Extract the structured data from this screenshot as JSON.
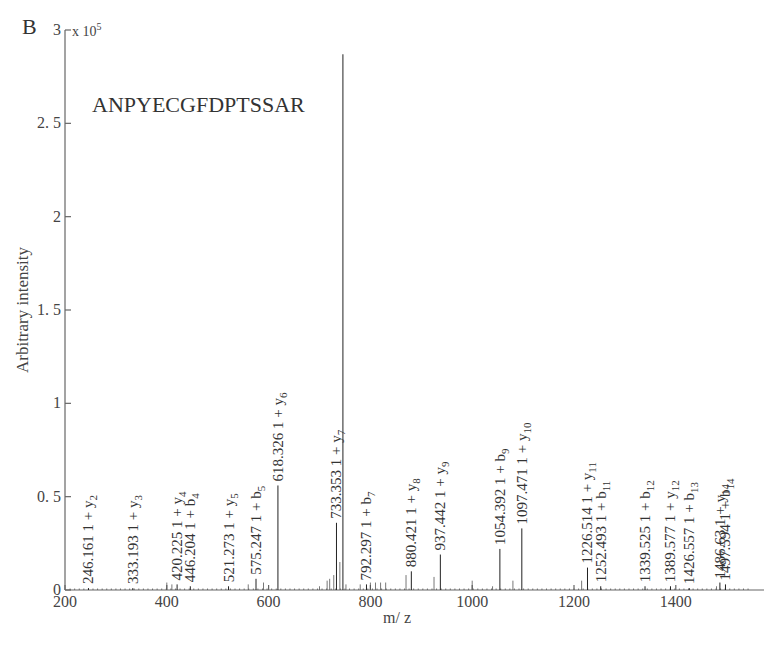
{
  "panel_label": "B",
  "peptide": "ANPYECGFDPTSSAR",
  "y_multiplier": "x 10^5",
  "chart_data": {
    "type": "bar",
    "title": "ANPYECGFDPTSSAR",
    "panel": "B",
    "xlabel": "m/ z",
    "ylabel": "Arbitrary intensity",
    "y_scale_note": "x 10^5",
    "xlim": [
      200,
      1560
    ],
    "ylim": [
      0,
      3
    ],
    "x_ticks": [
      200,
      400,
      600,
      800,
      1000,
      1200,
      1400
    ],
    "y_ticks": [
      0,
      0.5,
      1,
      1.5,
      2,
      2.5,
      3
    ],
    "y_tick_labels": [
      "0",
      "0. 5",
      "1",
      "1. 5",
      "2",
      "2. 5",
      "3"
    ],
    "grid": false,
    "legend": null,
    "precursor_peak": {
      "mz": 746,
      "intensity": 2.87
    },
    "annotated_peaks": [
      {
        "mz": 246.161,
        "label": "246.161",
        "ion": "1 + y2",
        "ion_type": "y",
        "ion_index": 2,
        "intensity": 0.01
      },
      {
        "mz": 333.193,
        "label": "333.193",
        "ion": "1 + y3",
        "ion_type": "y",
        "ion_index": 3,
        "intensity": 0.01
      },
      {
        "mz": 420.225,
        "label": "420.225",
        "ion": "1 + y4",
        "ion_type": "y",
        "ion_index": 4,
        "intensity": 0.03
      },
      {
        "mz": 446.204,
        "label": "446.204",
        "ion": "1 + b4",
        "ion_type": "b",
        "ion_index": 4,
        "intensity": 0.02
      },
      {
        "mz": 521.273,
        "label": "521.273",
        "ion": "1 + y5",
        "ion_type": "y",
        "ion_index": 5,
        "intensity": 0.02
      },
      {
        "mz": 575.247,
        "label": "575.247",
        "ion": "1 + b5",
        "ion_type": "b",
        "ion_index": 5,
        "intensity": 0.06
      },
      {
        "mz": 618.326,
        "label": "618.326",
        "ion": "1 + y6",
        "ion_type": "y",
        "ion_index": 6,
        "intensity": 0.56
      },
      {
        "mz": 733.353,
        "label": "733.353",
        "ion": "1 + y7",
        "ion_type": "y",
        "ion_index": 7,
        "intensity": 0.36
      },
      {
        "mz": 792.297,
        "label": "792.297",
        "ion": "1 + b7",
        "ion_type": "b",
        "ion_index": 7,
        "intensity": 0.03
      },
      {
        "mz": 880.421,
        "label": "880.421",
        "ion": "1 + y8",
        "ion_type": "y",
        "ion_index": 8,
        "intensity": 0.1
      },
      {
        "mz": 937.442,
        "label": "937.442",
        "ion": "1 + y9",
        "ion_type": "y",
        "ion_index": 9,
        "intensity": 0.19
      },
      {
        "mz": 1054.392,
        "label": "1054.392",
        "ion": "1 + b9",
        "ion_type": "b",
        "ion_index": 9,
        "intensity": 0.22
      },
      {
        "mz": 1097.471,
        "label": "1097.471",
        "ion": "1 + y10",
        "ion_type": "y",
        "ion_index": 10,
        "intensity": 0.33
      },
      {
        "mz": 1226.514,
        "label": "1226.514",
        "ion": "1 + y11",
        "ion_type": "y",
        "ion_index": 11,
        "intensity": 0.12
      },
      {
        "mz": 1252.493,
        "label": "1252.493",
        "ion": "1 + b11",
        "ion_type": "b",
        "ion_index": 11,
        "intensity": 0.02
      },
      {
        "mz": 1339.525,
        "label": "1339.525",
        "ion": "1 + b12",
        "ion_type": "b",
        "ion_index": 12,
        "intensity": 0.02
      },
      {
        "mz": 1389.577,
        "label": "1389.577",
        "ion": "1 + y12",
        "ion_type": "y",
        "ion_index": 12,
        "intensity": 0.02
      },
      {
        "mz": 1426.557,
        "label": "1426.557",
        "ion": "1 + b13",
        "ion_type": "b",
        "ion_index": 13,
        "intensity": 0.01
      },
      {
        "mz": 1486.63,
        "label": "1486.63",
        "ion": "1 + y14",
        "ion_type": "y",
        "ion_index": 14,
        "intensity": 0.04
      },
      {
        "mz": 1497.594,
        "label": "1497.594",
        "ion": "1 + b14",
        "ion_type": "b",
        "ion_index": 14,
        "intensity": 0.03
      }
    ],
    "minor_peaks": [
      {
        "mz": 400,
        "intensity": 0.04
      },
      {
        "mz": 410,
        "intensity": 0.03
      },
      {
        "mz": 560,
        "intensity": 0.03
      },
      {
        "mz": 590,
        "intensity": 0.04
      },
      {
        "mz": 700,
        "intensity": 0.02
      },
      {
        "mz": 715,
        "intensity": 0.05
      },
      {
        "mz": 720,
        "intensity": 0.06
      },
      {
        "mz": 728,
        "intensity": 0.08
      },
      {
        "mz": 740,
        "intensity": 0.15
      },
      {
        "mz": 752,
        "intensity": 0.03
      },
      {
        "mz": 780,
        "intensity": 0.03
      },
      {
        "mz": 800,
        "intensity": 0.04
      },
      {
        "mz": 810,
        "intensity": 0.04
      },
      {
        "mz": 820,
        "intensity": 0.04
      },
      {
        "mz": 830,
        "intensity": 0.04
      },
      {
        "mz": 870,
        "intensity": 0.08
      },
      {
        "mz": 925,
        "intensity": 0.07
      },
      {
        "mz": 1000,
        "intensity": 0.05
      },
      {
        "mz": 1040,
        "intensity": 0.02
      },
      {
        "mz": 1080,
        "intensity": 0.05
      },
      {
        "mz": 1215,
        "intensity": 0.05
      },
      {
        "mz": 1480,
        "intensity": 0.02
      }
    ]
  }
}
